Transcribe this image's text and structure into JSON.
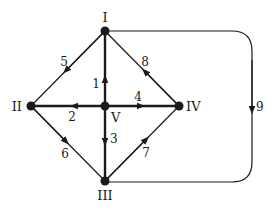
{
  "diagram": {
    "type": "directed-graph",
    "colors": {
      "stroke": "#1a1a1a",
      "background": "#ffffff"
    },
    "nodes": [
      {
        "id": "I",
        "label": "I",
        "x": 105,
        "y": 31
      },
      {
        "id": "II",
        "label": "II",
        "x": 31,
        "y": 106
      },
      {
        "id": "III",
        "label": "III",
        "x": 105,
        "y": 181
      },
      {
        "id": "IV",
        "label": "IV",
        "x": 179,
        "y": 106
      },
      {
        "id": "V",
        "label": "V",
        "x": 105,
        "y": 106
      }
    ],
    "edges": [
      {
        "id": "1",
        "label": "1",
        "from": "V",
        "to": "I",
        "bold": true
      },
      {
        "id": "2",
        "label": "2",
        "from": "V",
        "to": "II",
        "bold": true
      },
      {
        "id": "3",
        "label": "3",
        "from": "V",
        "to": "III",
        "bold": true
      },
      {
        "id": "4",
        "label": "4",
        "from": "V",
        "to": "IV",
        "bold": true
      },
      {
        "id": "5",
        "label": "5",
        "from": "I",
        "to": "II",
        "bold": false
      },
      {
        "id": "6",
        "label": "6",
        "from": "II",
        "to": "III",
        "bold": false
      },
      {
        "id": "7",
        "label": "7",
        "from": "III",
        "to": "IV",
        "bold": false
      },
      {
        "id": "8",
        "label": "8",
        "from": "IV",
        "to": "I",
        "bold": false
      },
      {
        "id": "9",
        "label": "9",
        "from": "I",
        "to": "III",
        "bold": false,
        "curved": true
      }
    ]
  }
}
